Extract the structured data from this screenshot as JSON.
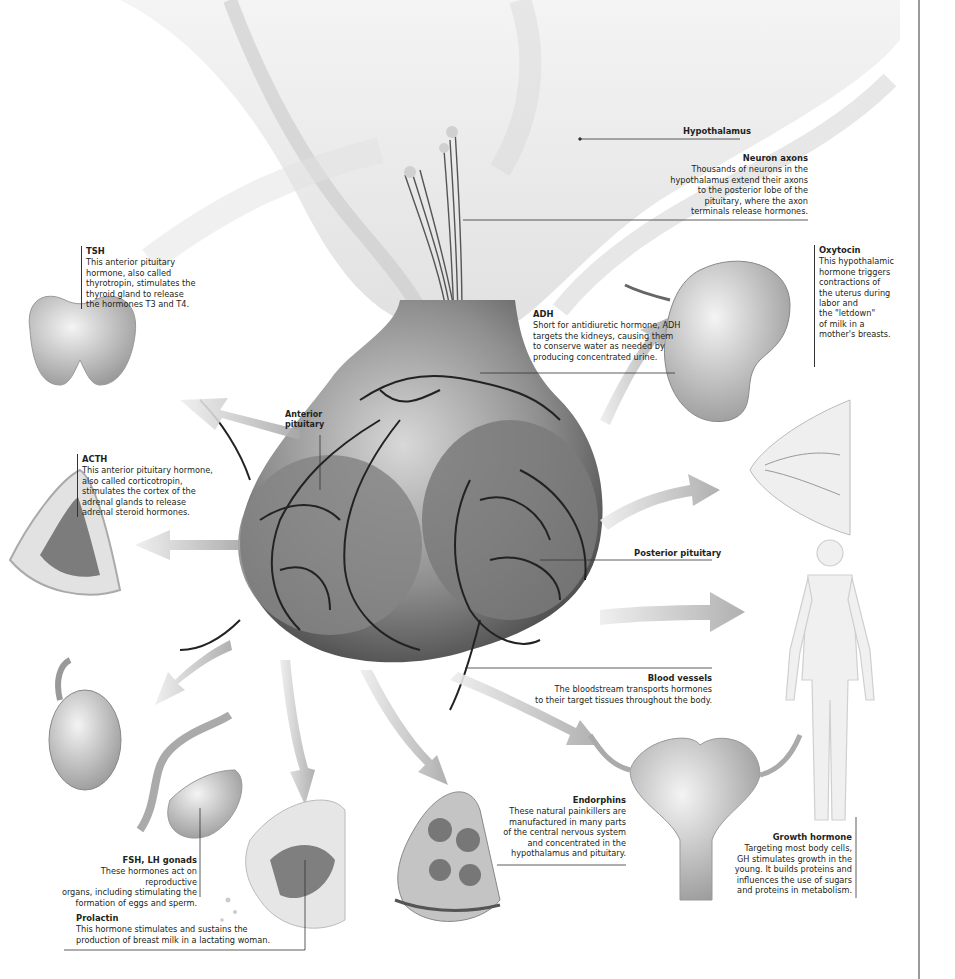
{
  "diagram": {
    "colors": {
      "background": "#ffffff",
      "gland": "#8c8c8c",
      "vessel": "#2a2a2a",
      "arrow": "#bdbdbd",
      "text": "#231f20",
      "rule": "#9a9a9a"
    }
  },
  "labels": {
    "hypothalamus": "Hypothalamus",
    "anterior_pituitary_l1": "Anterior",
    "anterior_pituitary_l2": "pituitary",
    "posterior_pituitary": "Posterior pituitary"
  },
  "callouts": {
    "neuron_axons": {
      "title": "Neuron axons",
      "lines": [
        "Thousands of neurons in the",
        "hypothalamus extend their axons",
        "to the posterior lobe of the",
        "pituitary, where the axon",
        "terminals release hormones."
      ]
    },
    "tsh": {
      "title": "TSH",
      "lines": [
        "This anterior pituitary",
        "hormone, also called",
        "thyrotropin, stimulates the",
        "thyroid gland to release",
        "the hormones T3 and T4."
      ]
    },
    "adh": {
      "title": "ADH",
      "lines": [
        "Short for antidiuretic hormone, ADH",
        "targets the kidneys, causing them",
        "to conserve water as needed by",
        "producing concentrated urine."
      ]
    },
    "oxytocin": {
      "title": "Oxytocin",
      "lines": [
        "This hypothalamic",
        "hormone triggers",
        "contractions of",
        "the uterus during",
        "labor and",
        "the \"letdown\"",
        "of milk in a",
        "mother's breasts."
      ]
    },
    "acth": {
      "title": "ACTH",
      "lines": [
        "This anterior pituitary hormone,",
        "also called corticotropin,",
        "stimulates the cortex of the",
        "adrenal glands to release",
        "adrenal steroid hormones."
      ]
    },
    "blood_vessels": {
      "title": "Blood vessels",
      "lines": [
        "The bloodstream transports hormones",
        "to their target tissues throughout the body."
      ]
    },
    "endorphins": {
      "title": "Endorphins",
      "lines": [
        "These natural painkillers are",
        "manufactured in many parts",
        "of the central nervous system",
        "and concentrated in the",
        "hypothalamus and pituitary."
      ]
    },
    "growth_hormone": {
      "title": "Growth hormone",
      "lines": [
        "Targeting most body cells,",
        "GH stimulates growth in the",
        "young. It builds proteins and",
        "influences the use of sugars",
        "and proteins in metabolism."
      ]
    },
    "fsh_lh": {
      "title": "FSH, LH gonads",
      "lines": [
        "These hormones act on reproductive",
        "organs, including stimulating the",
        "formation of eggs and sperm."
      ]
    },
    "prolactin": {
      "title": "Prolactin",
      "lines": [
        "This hormone stimulates and sustains the",
        "production of breast milk in a lactating woman."
      ]
    }
  }
}
